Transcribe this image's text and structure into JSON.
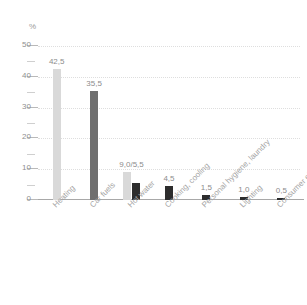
{
  "chart_data": {
    "type": "bar",
    "title": "",
    "subtitle": "",
    "xlabel": "",
    "ylabel": "%",
    "ylim": [
      0,
      50
    ],
    "ytick_values": [
      0,
      10,
      20,
      30,
      40,
      50
    ],
    "ytick_labels": [
      "0",
      "10",
      "20",
      "30",
      "40",
      "50"
    ],
    "yminor_values": [
      5,
      15,
      25,
      35,
      45
    ],
    "grid": "horizontal-dotted",
    "legend": "none",
    "categories": [
      "Heating",
      "Car fuels",
      "Hot water",
      "Cooking, cooling",
      "Personal hygiene, laundry",
      "Lighting",
      "Consumer electronics"
    ],
    "groups": [
      {
        "category": "Heating",
        "label": "42,5",
        "bars": [
          {
            "value": 42.5,
            "color": "#d9d9d9",
            "tone": "light"
          }
        ]
      },
      {
        "category": "Car fuels",
        "label": "35,5",
        "bars": [
          {
            "value": 35.5,
            "color": "#6f6f6f",
            "tone": "mid"
          }
        ]
      },
      {
        "category": "Hot water",
        "label": "9,0/5,5",
        "bars": [
          {
            "value": 9.0,
            "color": "#d9d9d9",
            "tone": "light"
          },
          {
            "value": 5.5,
            "color": "#2d2d2d",
            "tone": "dark"
          }
        ]
      },
      {
        "category": "Cooking, cooling",
        "label": "4,5",
        "bars": [
          {
            "value": 4.5,
            "color": "#2d2d2d",
            "tone": "dark"
          }
        ]
      },
      {
        "category": "Personal hygiene, laundry",
        "label": "1,5",
        "bars": [
          {
            "value": 1.5,
            "color": "#2d2d2d",
            "tone": "dark"
          }
        ]
      },
      {
        "category": "Lighting",
        "label": "1,0",
        "bars": [
          {
            "value": 1.0,
            "color": "#2d2d2d",
            "tone": "dark"
          }
        ]
      },
      {
        "category": "Consumer electronics",
        "label": "0,5",
        "bars": [
          {
            "value": 0.5,
            "color": "#2d2d2d",
            "tone": "dark"
          }
        ]
      }
    ],
    "colors": {
      "light_bar": "#d9d9d9",
      "mid_bar": "#6f6f6f",
      "dark_bar": "#2d2d2d",
      "gridline": "#dedede",
      "axis": "#a8a8a8",
      "text": "#8f8f8f",
      "background": "#ffffff"
    }
  }
}
